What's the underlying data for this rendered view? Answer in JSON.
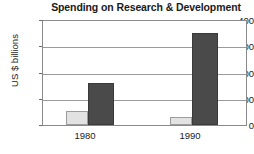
{
  "chart_data": {
    "type": "bar",
    "title": "Spending on Research & Development",
    "xlabel": "",
    "ylabel": "US $ billions",
    "categories": [
      "1980",
      "1990"
    ],
    "ylim": [
      0,
      400
    ],
    "yticks": [
      0,
      100,
      200,
      300,
      400
    ],
    "ytick_labels": [
      "0",
      "100",
      "200",
      "300",
      "400"
    ],
    "grid": true,
    "legend": "none",
    "series": [
      {
        "name": "series-1",
        "color": "#e2e2e2",
        "values": [
          54,
          31
        ]
      },
      {
        "name": "series-2",
        "color": "#4a4a4a",
        "values": [
          162,
          354
        ]
      }
    ]
  },
  "axis": {
    "y_title": "US $ billions",
    "tick_0": "0",
    "tick_100": "100",
    "tick_200": "200",
    "tick_300": "300",
    "tick_400": "400",
    "x_label_1": "1980",
    "x_label_2": "1990"
  },
  "colors": {
    "light_bar": "#e2e2e2",
    "dark_bar": "#4a4a4a",
    "gridline": "#9a9a9a",
    "frame": "#8a8a8a",
    "text": "#1a1a1a",
    "background": "#ffffff"
  }
}
